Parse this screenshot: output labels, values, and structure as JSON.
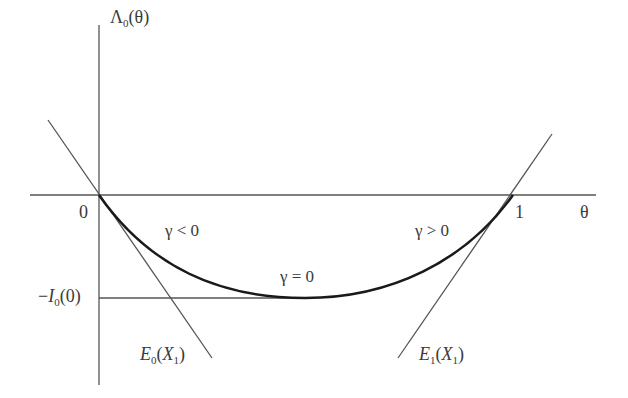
{
  "diagram": {
    "y_axis_label": {
      "main": "Λ",
      "sub": "0",
      "arg": "(θ)"
    },
    "x_axis_label": "θ",
    "origin_label": "0",
    "one_label": "1",
    "min_label": {
      "prefix": "−",
      "main": "I",
      "sub": "0",
      "arg": "(0)"
    },
    "region_labels": {
      "left": "γ < 0",
      "middle": "γ = 0",
      "right": "γ > 0"
    },
    "tangent_left": {
      "main": "E",
      "sub": "0",
      "open": "(",
      "var": "X",
      "varsub": "1",
      "close": ")"
    },
    "tangent_right": {
      "main": "E",
      "sub": "1",
      "open": "(",
      "var": "X",
      "varsub": "1",
      "close": ")"
    },
    "colors": {
      "axis": "#555555",
      "curve": "#1a1a1a",
      "text": "#3a3a3a"
    }
  }
}
